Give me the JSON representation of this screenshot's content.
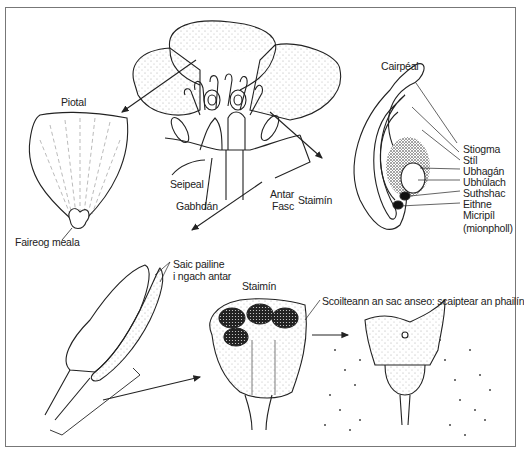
{
  "diagram": {
    "type": "botanical-illustration",
    "language": "Irish",
    "panels": {
      "petal": {
        "title": "Piotal",
        "labels": {
          "nectary": "Faireog meala"
        }
      },
      "flower": {
        "labels": {
          "sepal": "Seipeal",
          "receptacle": "Gabhdán",
          "anther": "Antar",
          "filament": "Fasc",
          "stamen_group": "Staimín"
        }
      },
      "carpel": {
        "title": "Cairpéal",
        "labels": [
          "Stiogma",
          "Stíl",
          "Ubhagán",
          "Ubhúlach",
          "Suthshac",
          "Eithne",
          "Micripíl",
          "(mionpholl)"
        ]
      },
      "anther_detail": {
        "labels": {
          "pollen_sacs_line1": "Saic pailine",
          "pollen_sacs_line2": "i ngach antar"
        }
      },
      "stamen_section": {
        "title": "Staimín",
        "labels": {
          "dehiscence": "Scoilteann an sac anseo: scaiptear an phailín"
        }
      }
    }
  }
}
